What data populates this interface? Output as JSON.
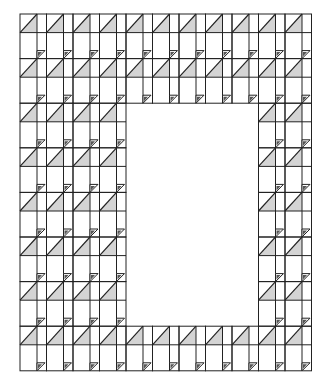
{
  "diagram": {
    "type": "quilt-pattern-grid",
    "origin": [
      20,
      14
    ],
    "columns": 11,
    "rows": 8,
    "column_pitch": 26.5,
    "row_pitch": 44.6,
    "square_width": 17,
    "strip_width": 9.5,
    "triangle_row_height": 18.6,
    "plain_row_height": 26,
    "hole": {
      "col_start": 4,
      "col_end": 9,
      "row_start": 2,
      "row_end": 7
    },
    "colors": {
      "line": "#222222",
      "triangle_fill": "#d4d4d4",
      "small_triangle_fill": "#555555",
      "background": "#ffffff"
    },
    "elements": {
      "large_triangle": "half-square triangle, diagonal bottom-left to top-right, lower-right shaded",
      "small_triangle": "small dark triangle at bottom of narrow strip"
    }
  }
}
